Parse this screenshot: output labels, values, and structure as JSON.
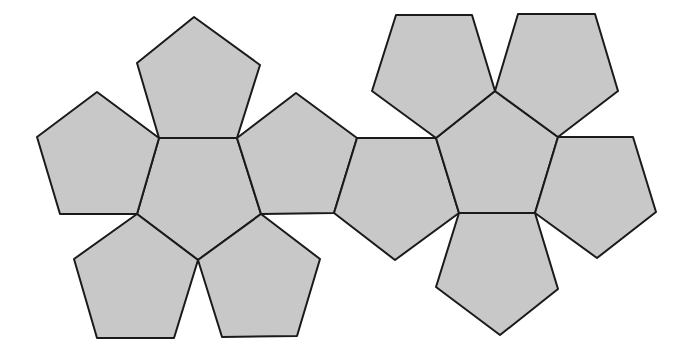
{
  "diagram": {
    "title": "Dodecahedron net",
    "type": "polyhedron-net",
    "fill_color": "#c8c8c8",
    "stroke_color": "#1a1a1a",
    "background": "#ffffff",
    "stroke_width": 2,
    "faces": [
      {
        "id": "left-top",
        "points": "194,17 260,65 237,138 159,138 137,63"
      },
      {
        "id": "left-center",
        "points": "159,138 237,138 261,214 198,260 137,214"
      },
      {
        "id": "left-left",
        "points": "97,92 159,138 137,214 60,214 37,137"
      },
      {
        "id": "left-right",
        "points": "296,93 357,138 334,213 261,214 237,138"
      },
      {
        "id": "left-bottom-left",
        "points": "137,214 198,260 174,338 97,338 74,259"
      },
      {
        "id": "left-bottom-right",
        "points": "198,260 261,214 320,259 297,336 222,337"
      },
      {
        "id": "bridge",
        "points": "357,138 436,138 459,213 395,260 334,213"
      },
      {
        "id": "right-center",
        "points": "495,91 558,137 535,213 459,213 436,138"
      },
      {
        "id": "right-top-left",
        "points": "396,15 472,15 495,91 436,138 372,91"
      },
      {
        "id": "right-top-right",
        "points": "518,14 595,14 618,91 558,137 495,91"
      },
      {
        "id": "right-right",
        "points": "558,137 633,137 656,212 597,258 535,213"
      },
      {
        "id": "right-bottom",
        "points": "459,213 535,213 558,289 500,335 436,287"
      }
    ],
    "face_count": 12
  }
}
